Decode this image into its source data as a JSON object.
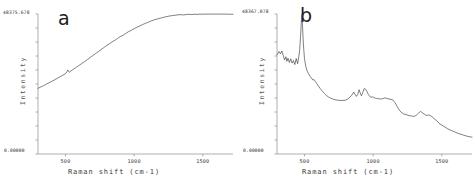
{
  "figure": {
    "title": "",
    "panels": [
      {
        "letter": "a",
        "ymax_label": "48375.678",
        "ymin_label": "0.00000",
        "ylabel": "Intensity",
        "xlabel": "Raman shift (cm-1)",
        "xticks": [
          "500",
          "1000",
          "1500"
        ]
      },
      {
        "letter": "b",
        "ymax_label": "48367.078",
        "ymin_label": "0.00000",
        "ylabel": "Intensity",
        "xlabel": "Raman shift (cm-1)",
        "xticks": [
          "500",
          "1000",
          "1500"
        ]
      }
    ]
  },
  "chart_data": [
    {
      "type": "line",
      "panel": "a",
      "title": "",
      "xlabel": "Raman shift (cm-1)",
      "ylabel": "Intensity",
      "xlim": [
        300,
        1720
      ],
      "ylim": [
        0,
        48375.678
      ],
      "ytick_labels": [
        "0.00000",
        "48375.678"
      ],
      "xtick_values": [
        500,
        1000,
        1500
      ],
      "grid": false,
      "legend": false,
      "description": "Broad monotonically rising fluorescence background with a small bump near 520 cm-1, plateauing above about 1400 cm-1.",
      "x": [
        300,
        320,
        340,
        360,
        380,
        400,
        420,
        440,
        460,
        480,
        500,
        510,
        518,
        524,
        530,
        540,
        560,
        580,
        600,
        620,
        640,
        660,
        680,
        700,
        720,
        740,
        760,
        780,
        800,
        820,
        840,
        860,
        880,
        900,
        920,
        940,
        960,
        980,
        1000,
        1020,
        1040,
        1060,
        1080,
        1100,
        1120,
        1140,
        1160,
        1180,
        1200,
        1220,
        1240,
        1260,
        1280,
        1300,
        1320,
        1340,
        1360,
        1380,
        1400,
        1420,
        1440,
        1460,
        1480,
        1500,
        1520,
        1540,
        1560,
        1580,
        1600,
        1620,
        1640,
        1660,
        1680,
        1700,
        1720
      ],
      "y": [
        22700,
        23150,
        23600,
        24100,
        24600,
        25100,
        25600,
        26150,
        26700,
        27200,
        27700,
        28400,
        29000,
        28450,
        28300,
        28700,
        29350,
        30000,
        30650,
        31300,
        31950,
        32650,
        33350,
        34050,
        34750,
        35400,
        36100,
        36800,
        37500,
        38100,
        38750,
        39300,
        39950,
        40600,
        41050,
        41700,
        42300,
        42750,
        43300,
        43800,
        44200,
        44700,
        45100,
        45500,
        45900,
        46250,
        46550,
        46800,
        47050,
        47300,
        47500,
        47700,
        47850,
        47950,
        48100,
        48150,
        48050,
        48200,
        48280,
        48180,
        48300,
        48250,
        48330,
        48300,
        48350,
        48330,
        48360,
        48340,
        48350,
        48345,
        48340,
        48330,
        48320,
        48300,
        48280
      ]
    },
    {
      "type": "line",
      "panel": "b",
      "title": "",
      "xlabel": "Raman shift (cm-1)",
      "ylabel": "Intensity",
      "xlim": [
        300,
        1720
      ],
      "ylim": [
        0,
        48367.078
      ],
      "ytick_labels": [
        "0.00000",
        "48367.078"
      ],
      "xtick_values": [
        500,
        1000,
        1500
      ],
      "grid": false,
      "legend": false,
      "description": "Sharp intense peak near 480 cm-1 on a decaying background, with a multi-peak band between about 850 and 1150 cm-1 and weaker features near 1300-1450 cm-1, decaying to baseline by 1700 cm-1.",
      "x": [
        300,
        315,
        325,
        335,
        345,
        355,
        365,
        372,
        380,
        390,
        400,
        410,
        420,
        430,
        440,
        450,
        458,
        465,
        472,
        478,
        482,
        486,
        492,
        500,
        510,
        520,
        530,
        540,
        550,
        560,
        570,
        580,
        590,
        600,
        615,
        630,
        645,
        660,
        675,
        690,
        705,
        720,
        740,
        760,
        780,
        800,
        815,
        830,
        845,
        858,
        868,
        878,
        888,
        898,
        905,
        915,
        925,
        935,
        945,
        955,
        965,
        975,
        985,
        995,
        1005,
        1015,
        1025,
        1040,
        1055,
        1070,
        1085,
        1100,
        1115,
        1130,
        1145,
        1160,
        1175,
        1190,
        1205,
        1220,
        1240,
        1260,
        1280,
        1300,
        1315,
        1330,
        1345,
        1360,
        1375,
        1390,
        1405,
        1420,
        1435,
        1450,
        1465,
        1480,
        1500,
        1520,
        1540,
        1560,
        1580,
        1600,
        1620,
        1640,
        1660,
        1680,
        1700,
        1720
      ],
      "y": [
        34300,
        35400,
        34600,
        35600,
        34100,
        32500,
        33600,
        32000,
        33100,
        31600,
        32900,
        31400,
        32300,
        30900,
        33000,
        31200,
        33400,
        35800,
        41000,
        46500,
        48360,
        44000,
        38000,
        33000,
        30200,
        28600,
        27700,
        26900,
        26300,
        25600,
        25700,
        25000,
        24300,
        23600,
        22600,
        21700,
        20900,
        20200,
        19700,
        19300,
        19000,
        18800,
        18600,
        18500,
        18500,
        18600,
        19000,
        19600,
        20300,
        21400,
        20600,
        19900,
        20600,
        22200,
        21200,
        20100,
        21300,
        22600,
        22400,
        21600,
        20600,
        19900,
        19600,
        19800,
        19500,
        19300,
        19200,
        19100,
        19000,
        19100,
        19400,
        19200,
        19000,
        18900,
        18600,
        17700,
        16400,
        15200,
        14400,
        13900,
        13600,
        13300,
        13100,
        13000,
        13400,
        14100,
        14700,
        14200,
        13700,
        13300,
        13500,
        13200,
        12600,
        12000,
        11400,
        10600,
        10000,
        9400,
        8800,
        8300,
        7900,
        7500,
        7100,
        6800,
        6500,
        6200,
        6000,
        5800
      ]
    }
  ]
}
